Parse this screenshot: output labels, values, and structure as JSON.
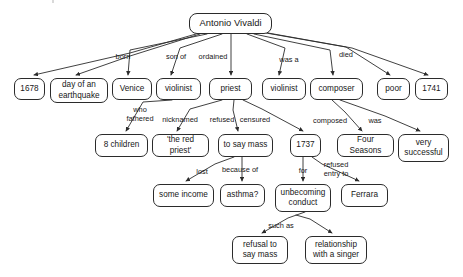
{
  "diagram": {
    "type": "concept-map",
    "stroke_color": "#2b2b2b",
    "text_color": "#171717",
    "background_color": "#ffffff"
  },
  "nodes": [
    {
      "id": "vivaldi",
      "label": "Antonio Vivaldi",
      "x": 189,
      "y": 13,
      "w": 83,
      "h": 21,
      "root": true
    },
    {
      "id": "1678",
      "label": "1678",
      "x": 14,
      "y": 78,
      "w": 31,
      "h": 22
    },
    {
      "id": "earthquake",
      "label": "day of an\nearthquake",
      "x": 50,
      "y": 78,
      "w": 58,
      "h": 25
    },
    {
      "id": "venice",
      "label": "Venice",
      "x": 112,
      "y": 78,
      "w": 40,
      "h": 22
    },
    {
      "id": "violinist-son",
      "label": "violinist",
      "x": 156,
      "y": 78,
      "w": 45,
      "h": 22
    },
    {
      "id": "priest",
      "label": "priest",
      "x": 209,
      "y": 78,
      "w": 43,
      "h": 22
    },
    {
      "id": "violinist-was",
      "label": "violinist",
      "x": 262,
      "y": 78,
      "w": 44,
      "h": 22
    },
    {
      "id": "composer",
      "label": "composer",
      "x": 310,
      "y": 78,
      "w": 53,
      "h": 22
    },
    {
      "id": "poor",
      "label": "poor",
      "x": 377,
      "y": 78,
      "w": 33,
      "h": 22
    },
    {
      "id": "1741",
      "label": "1741",
      "x": 415,
      "y": 78,
      "w": 33,
      "h": 22
    },
    {
      "id": "8children",
      "label": "8 children",
      "x": 95,
      "y": 134,
      "w": 53,
      "h": 23
    },
    {
      "id": "redpriest",
      "label": "'the red priest'",
      "x": 152,
      "y": 134,
      "w": 57,
      "h": 23
    },
    {
      "id": "tosaymass",
      "label": "to say mass",
      "x": 218,
      "y": 134,
      "w": 55,
      "h": 23
    },
    {
      "id": "1737",
      "label": "1737",
      "x": 290,
      "y": 134,
      "w": 31,
      "h": 23
    },
    {
      "id": "fourseasons",
      "label": "Four Seasons",
      "x": 337,
      "y": 134,
      "w": 57,
      "h": 23
    },
    {
      "id": "verysuccessful",
      "label": "very\nsuccessful",
      "x": 398,
      "y": 134,
      "w": 51,
      "h": 28
    },
    {
      "id": "someincome",
      "label": "some income",
      "x": 153,
      "y": 184,
      "w": 61,
      "h": 23
    },
    {
      "id": "asthma",
      "label": "asthma?",
      "x": 220,
      "y": 184,
      "w": 45,
      "h": 23
    },
    {
      "id": "unbecoming",
      "label": "unbecoming\nconduct",
      "x": 275,
      "y": 184,
      "w": 56,
      "h": 28
    },
    {
      "id": "ferrara",
      "label": "Ferrara",
      "x": 341,
      "y": 184,
      "w": 47,
      "h": 23
    },
    {
      "id": "refusalsaymass",
      "label": "refusal to\nsay mass",
      "x": 232,
      "y": 236,
      "w": 56,
      "h": 28
    },
    {
      "id": "relationship",
      "label": "relationship\nwith a singer",
      "x": 305,
      "y": 236,
      "w": 62,
      "h": 28
    }
  ],
  "edge_labels": [
    {
      "id": "born",
      "label": "born",
      "x": 123,
      "y": 53
    },
    {
      "id": "son-of",
      "label": "son of",
      "x": 176,
      "y": 53
    },
    {
      "id": "ordained",
      "label": "ordained",
      "x": 213,
      "y": 53
    },
    {
      "id": "was-a",
      "label": "was a",
      "x": 289,
      "y": 56
    },
    {
      "id": "died",
      "label": "died",
      "x": 346,
      "y": 51
    },
    {
      "id": "who-fathered",
      "label": "who\nfathered",
      "x": 140,
      "y": 106
    },
    {
      "id": "nicknamed",
      "label": "nicknamed",
      "x": 180,
      "y": 116
    },
    {
      "id": "refused",
      "label": "refused",
      "x": 222,
      "y": 116
    },
    {
      "id": "censured",
      "label": "censured",
      "x": 255,
      "y": 116
    },
    {
      "id": "composed",
      "label": "composed",
      "x": 330,
      "y": 117
    },
    {
      "id": "was",
      "label": "was",
      "x": 375,
      "y": 117
    },
    {
      "id": "lost",
      "label": "lost",
      "x": 202,
      "y": 168
    },
    {
      "id": "because-of",
      "label": "because of",
      "x": 240,
      "y": 166
    },
    {
      "id": "for",
      "label": "for",
      "x": 303,
      "y": 167
    },
    {
      "id": "refused-entry-to",
      "label": "refused\nentry to",
      "x": 336,
      "y": 161
    },
    {
      "id": "such-as",
      "label": "such as",
      "x": 281,
      "y": 222
    }
  ],
  "edges": [
    {
      "from": "vivaldi",
      "to": "1678",
      "label": "born"
    },
    {
      "from": "vivaldi",
      "to": "earthquake",
      "label": "born"
    },
    {
      "from": "vivaldi",
      "to": "venice",
      "label": "born"
    },
    {
      "from": "vivaldi",
      "to": "violinist-son",
      "label": "son of"
    },
    {
      "from": "vivaldi",
      "to": "priest",
      "label": "ordained"
    },
    {
      "from": "vivaldi",
      "to": "violinist-was",
      "label": "was a"
    },
    {
      "from": "vivaldi",
      "to": "composer",
      "label": "was a"
    },
    {
      "from": "vivaldi",
      "to": "poor",
      "label": "died"
    },
    {
      "from": "vivaldi",
      "to": "1741",
      "label": "died"
    },
    {
      "from": "violinist-son",
      "to": "8children",
      "label": "who fathered"
    },
    {
      "from": "priest",
      "to": "redpriest",
      "label": "nicknamed"
    },
    {
      "from": "priest",
      "to": "tosaymass",
      "label": "refused"
    },
    {
      "from": "priest",
      "to": "1737",
      "label": "censured"
    },
    {
      "from": "composer",
      "to": "fourseasons",
      "label": "composed"
    },
    {
      "from": "composer",
      "to": "verysuccessful",
      "label": "was"
    },
    {
      "from": "tosaymass",
      "to": "someincome",
      "label": "lost"
    },
    {
      "from": "tosaymass",
      "to": "asthma",
      "label": "because of"
    },
    {
      "from": "1737",
      "to": "unbecoming",
      "label": "for"
    },
    {
      "from": "1737",
      "to": "ferrara",
      "label": "refused entry to"
    },
    {
      "from": "unbecoming",
      "to": "refusalsaymass",
      "label": "such as"
    },
    {
      "from": "unbecoming",
      "to": "relationship",
      "label": "such as"
    }
  ],
  "connector_paths": [
    {
      "id": "vivaldi-to-1678",
      "d": "M 196 34 L 130 53 L 34 75"
    },
    {
      "id": "vivaldi-to-earthquake",
      "d": "M 200 34 L 130 56 L 76 75"
    },
    {
      "id": "vivaldi-to-venice",
      "d": "M 207 34 L 130 50 L 128 75"
    },
    {
      "id": "vivaldi-to-violinist",
      "d": "M 222 34 L 180 48 L 171 75"
    },
    {
      "id": "vivaldi-to-priest",
      "d": "M 231 34 L 231 75"
    },
    {
      "id": "vivaldi-to-violinist2",
      "d": "M 247 34 L 285 48 L 279 75"
    },
    {
      "id": "vivaldi-to-composer",
      "d": "M 254 34 L 330 50 L 333 75"
    },
    {
      "id": "vivaldi-to-poor",
      "d": "M 266 33 L 346 47 L 390 75"
    },
    {
      "id": "vivaldi-to-1741",
      "d": "M 268 33 L 352 48 L 428 75"
    },
    {
      "id": "violinist-to-8children",
      "d": "M 172 100 L 143 102 L 126 131"
    },
    {
      "id": "priest-to-redpriest",
      "d": "M 222 100 L 190 109 L 177 131"
    },
    {
      "id": "priest-to-tosaymass",
      "d": "M 234 100 L 233 110 L 238 131"
    },
    {
      "id": "priest-to-1737",
      "d": "M 243 100 L 262 109 L 303 131"
    },
    {
      "id": "composer-to-four",
      "d": "M 332 100 L 345 112 L 362 131"
    },
    {
      "id": "composer-to-verysucc",
      "d": "M 340 100 L 385 116 L 420 131"
    },
    {
      "id": "tosaymass-to-income",
      "d": "M 234 157 L 215 164 L 186 181"
    },
    {
      "id": "tosaymass-to-asthma",
      "d": "M 242 157 L 242 181"
    },
    {
      "id": "m1737-to-unbecoming",
      "d": "M 303 157 L 303 181"
    },
    {
      "id": "m1737-to-ferrara",
      "d": "M 312 157 L 322 164 L 359 181"
    },
    {
      "id": "unbec-to-refusal",
      "d": "M 305 212 L 288 218 L 262 233"
    },
    {
      "id": "unbec-to-relationship",
      "d": "M 296 215 L 310 219 L 332 233"
    }
  ]
}
